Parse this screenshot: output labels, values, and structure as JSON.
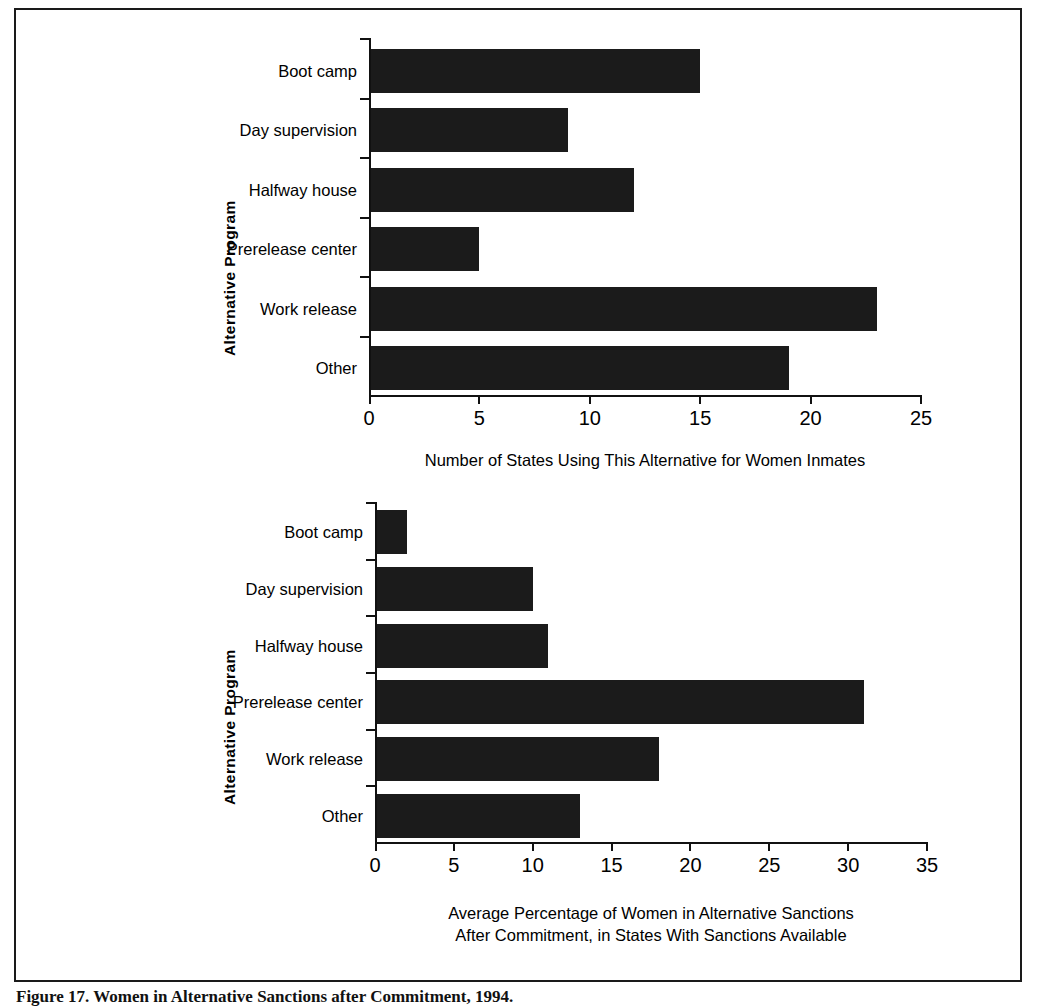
{
  "figure": {
    "caption": "Figure 17. Women in Alternative Sanctions after Commitment, 1994."
  },
  "chart_data": [
    {
      "type": "bar",
      "orientation": "horizontal",
      "id": "top",
      "title": "",
      "xlabel": "Number of States Using This Alternative for Women Inmates",
      "ylabel": "Alternative Program",
      "categories": [
        "Boot camp",
        "Day supervision",
        "Halfway house",
        "Prerelease center",
        "Work release",
        "Other"
      ],
      "values": [
        15,
        9,
        12,
        5,
        23,
        19
      ],
      "xlim": [
        0,
        25
      ],
      "xticks": [
        0,
        5,
        10,
        15,
        20,
        25
      ],
      "xticklabels": [
        "0",
        "5",
        "10",
        "15",
        "20",
        "25"
      ],
      "grid": false,
      "legend": null,
      "bar_color": "#1b1b1b"
    },
    {
      "type": "bar",
      "orientation": "horizontal",
      "id": "bottom",
      "title": "",
      "xlabel_line1": "Average Percentage of Women in Alternative Sanctions",
      "xlabel_line2": "After Commitment, in States With Sanctions Available",
      "ylabel": "Alternative Program",
      "categories": [
        "Boot camp",
        "Day supervision",
        "Halfway house",
        "Prerelease center",
        "Work release",
        "Other"
      ],
      "values": [
        2,
        10,
        11,
        31,
        18,
        13
      ],
      "xlim": [
        0,
        35
      ],
      "xticks": [
        0,
        5,
        10,
        15,
        20,
        25,
        30,
        35
      ],
      "xticklabels": [
        "0",
        "5",
        "10",
        "15",
        "20",
        "25",
        "30",
        "35"
      ],
      "grid": false,
      "legend": null,
      "bar_color": "#1b1b1b"
    }
  ]
}
